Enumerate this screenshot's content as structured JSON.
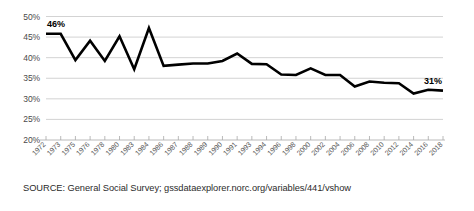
{
  "chart_data": {
    "type": "line",
    "title": "",
    "subtitle": "",
    "xlabel": "",
    "ylabel": "",
    "ylim": [
      20,
      50
    ],
    "ytick_labels": [
      "50%",
      "45%",
      "40%",
      "35%",
      "30%",
      "25%",
      "20%"
    ],
    "ytick_values": [
      50,
      45,
      40,
      35,
      30,
      25,
      20
    ],
    "grid": true,
    "legend": "none",
    "series_color": "#000000",
    "categories": [
      "1972",
      "1973",
      "1975",
      "1976",
      "1978",
      "1980",
      "1983",
      "1984",
      "1986",
      "1987",
      "1988",
      "1989",
      "1990",
      "1991",
      "1993",
      "1994",
      "1996",
      "1998",
      "2000",
      "2002",
      "2004",
      "2006",
      "2008",
      "2010",
      "2012",
      "2014",
      "2016",
      "2018"
    ],
    "values": [
      45.8,
      45.8,
      39.4,
      44.1,
      39.2,
      45.2,
      37.2,
      47.2,
      38.0,
      38.3,
      38.6,
      38.6,
      39.2,
      41.0,
      38.5,
      38.4,
      35.9,
      35.8,
      37.4,
      35.8,
      35.8,
      33.0,
      34.2,
      33.9,
      33.8,
      31.3,
      32.2,
      32.0
    ],
    "annotations": [
      {
        "label": "46%",
        "index": 0,
        "value": 45.8
      },
      {
        "label": "31%",
        "index": 27,
        "value": 32.0
      }
    ]
  },
  "source": {
    "note": "SOURCE: General Social Survey; gssdataexplorer.norc.org/variables/441/vshow"
  }
}
